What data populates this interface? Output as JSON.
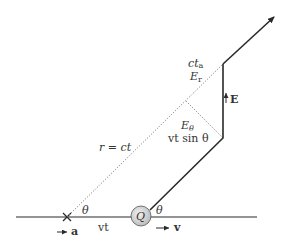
{
  "diagram": {
    "labels": {
      "ct_a": "ct",
      "ct_a_sub": "a",
      "E_r": "E",
      "E_r_sub": "r",
      "E_vector": "E",
      "E_theta": "E",
      "E_theta_sub": "θ",
      "vt_sin_theta": "vt sin θ",
      "r_eq_ct": "r = ct",
      "theta_left": "θ",
      "theta_right": "θ",
      "vt": "vt",
      "charge": "Q",
      "a": "a",
      "v": "v"
    },
    "colors": {
      "line": "#2a2a2a",
      "dotted": "#777777",
      "charge_fill": "#d9d9d9",
      "text": "#333333"
    }
  }
}
